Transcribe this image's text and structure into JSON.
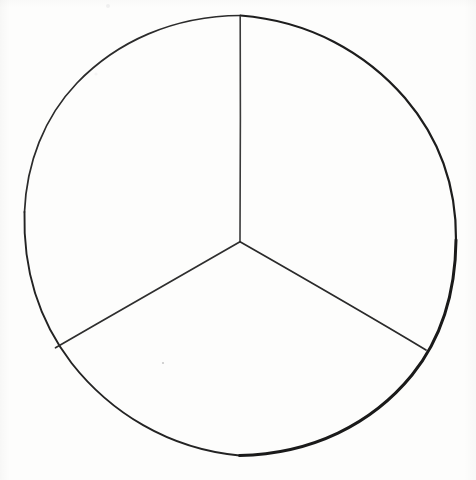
{
  "figure": {
    "medium": "hand-drawn ink line drawing on white paper",
    "background_color": "#fdfdfc",
    "ink_color": "#1a1a1a",
    "light_ink_color": "#3a3a3a",
    "canvas": {
      "width": 476,
      "height": 480
    },
    "circle": {
      "name": "outer-circle",
      "center_x": 240,
      "center_y": 240,
      "radius": 216,
      "bounds": {
        "left": 24,
        "right": 456,
        "top": 24,
        "bottom": 456
      },
      "stroke_width_thin": 1.6,
      "stroke_width_thick": 3.0,
      "stroke_color": "#1a1a1a"
    },
    "vertex": {
      "name": "center-vertex",
      "x": 240,
      "y": 242
    },
    "radii": [
      {
        "name": "radius-up",
        "label": "vertical radius to top",
        "angle_deg": 90,
        "from_x": 240,
        "from_y": 242,
        "to_x": 240,
        "to_y": 16,
        "stroke_width": 1.5
      },
      {
        "name": "radius-lower-left",
        "label": "radius to lower left",
        "angle_deg": 210,
        "from_x": 240,
        "from_y": 242,
        "to_x": 55,
        "to_y": 348,
        "stroke_width": 1.5
      },
      {
        "name": "radius-lower-right",
        "label": "radius to lower right",
        "angle_deg": 330,
        "from_x": 240,
        "from_y": 242,
        "to_x": 426,
        "to_y": 350,
        "stroke_width": 1.5
      }
    ],
    "sectors": [
      {
        "name": "sector-upper-left",
        "label": "upper left third",
        "fraction": "1/3",
        "angle_deg": 120,
        "fill": "none"
      },
      {
        "name": "sector-upper-right",
        "label": "upper right third",
        "fraction": "1/3",
        "angle_deg": 120,
        "fill": "none"
      },
      {
        "name": "sector-bottom",
        "label": "bottom third",
        "fraction": "1/3",
        "angle_deg": 120,
        "fill": "none"
      }
    ],
    "marks": [
      {
        "name": "pencil-speck",
        "x": 163,
        "y": 363,
        "radius": 1.1,
        "color": "#c9c9c9"
      },
      {
        "name": "faint-smudge-top",
        "x": 108,
        "y": 6,
        "radius": 2.0,
        "color": "#f0f0f0"
      }
    ]
  }
}
